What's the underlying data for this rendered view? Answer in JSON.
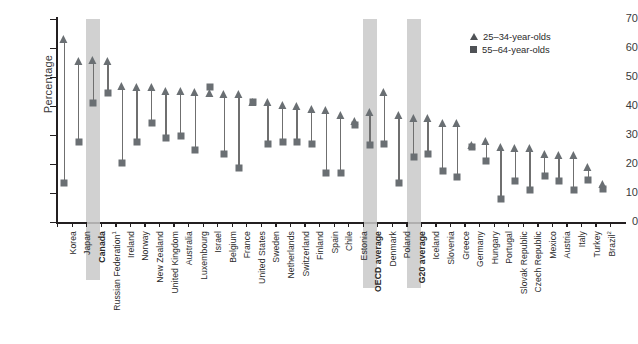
{
  "chart_data": {
    "type": "scatter",
    "title": "",
    "xlabel": "",
    "ylabel": "Percentage",
    "ylim": [
      0,
      70
    ],
    "yticks": [
      0,
      10,
      20,
      30,
      40,
      50,
      60,
      70
    ],
    "grid": false,
    "legend_position": "top-right",
    "legend": [
      "25–34-year-olds",
      "55–64-year-olds"
    ],
    "highlighted_categories": [
      "Canada",
      "OECD average",
      "G20 average"
    ],
    "categories": [
      "Korea",
      "Japan",
      "Canada",
      "Russian Federation¹",
      "Ireland",
      "Norway",
      "New Zealand",
      "United Kingdom",
      "Australia",
      "Luxembourg",
      "Israel",
      "Belgium",
      "France",
      "United States",
      "Sweden",
      "Netherlands",
      "Switzerland",
      "Finland",
      "Spain",
      "Chile",
      "Estonia",
      "OECD average",
      "Denmark",
      "Poland",
      "G20 average",
      "Iceland",
      "Slovenia",
      "Greece",
      "Germany",
      "Hungary",
      "Portugal",
      "Slovak Republic",
      "Czech Republic",
      "Mexico",
      "Austria",
      "Italy",
      "Turkey",
      "Brazil²"
    ],
    "series": [
      {
        "name": "25–34-year-olds",
        "marker": "triangle",
        "color": "#6a6f73",
        "values": [
          63.0,
          55.5,
          56.0,
          55.5,
          47.0,
          46.5,
          46.5,
          45.2,
          45.2,
          45.0,
          44.5,
          44.0,
          44.0,
          41.5,
          41.5,
          40.5,
          40.0,
          39.0,
          38.5,
          37.0,
          35.0,
          38.0,
          45.0,
          37.0,
          36.0,
          36.0,
          34.0,
          34.0,
          26.5,
          28.0,
          26.0,
          25.5,
          25.5,
          23.5,
          23.0,
          23.0,
          19.0,
          13.0
        ]
      },
      {
        "name": "55–64-year-olds",
        "marker": "square",
        "color": "#6a6f73",
        "values": [
          13.5,
          27.5,
          41.0,
          44.5,
          20.5,
          27.5,
          34.0,
          29.0,
          29.5,
          25.0,
          46.5,
          23.5,
          18.5,
          41.5,
          27.0,
          27.5,
          27.5,
          27.0,
          17.0,
          17.0,
          33.5,
          26.5,
          27.0,
          13.5,
          22.5,
          23.5,
          17.5,
          15.5,
          26.0,
          21.0,
          8.0,
          14.0,
          11.0,
          16.0,
          14.0,
          11.0,
          14.5,
          11.5
        ]
      }
    ]
  },
  "axis": {
    "ylabel": "Percentage"
  },
  "legend": {
    "items": [
      {
        "label": "25–34-year-olds",
        "marker": "triangle"
      },
      {
        "label": "55–64-year-olds",
        "marker": "square"
      }
    ]
  }
}
